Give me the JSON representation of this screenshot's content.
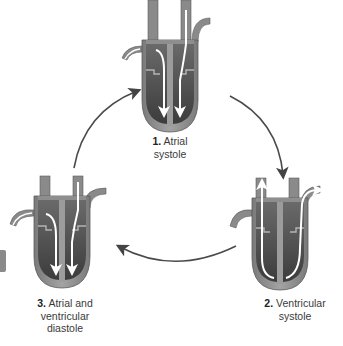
{
  "diagram": {
    "stages": [
      {
        "number": "1.",
        "name_line1": "Atrial",
        "name_line2": "systole",
        "name_line3": ""
      },
      {
        "number": "2.",
        "name_line1": "Ventricular",
        "name_line2": "systole",
        "name_line3": ""
      },
      {
        "number": "3.",
        "name_line1": "Atrial and",
        "name_line2": "ventricular",
        "name_line3": "diastole"
      }
    ],
    "cycle_arrows": [
      "stage1-to-stage2",
      "stage2-to-stage3",
      "stage3-to-stage1"
    ],
    "colors": {
      "heart_wall": "#8c8c8c",
      "heart_wall_light": "#a9a9a9",
      "chamber": "#5e5e5e",
      "chamber_dark": "#3f3f3f",
      "flow_arrow": "#ffffff",
      "cycle_arrow": "#4a4a4a",
      "text": "#333333"
    }
  }
}
